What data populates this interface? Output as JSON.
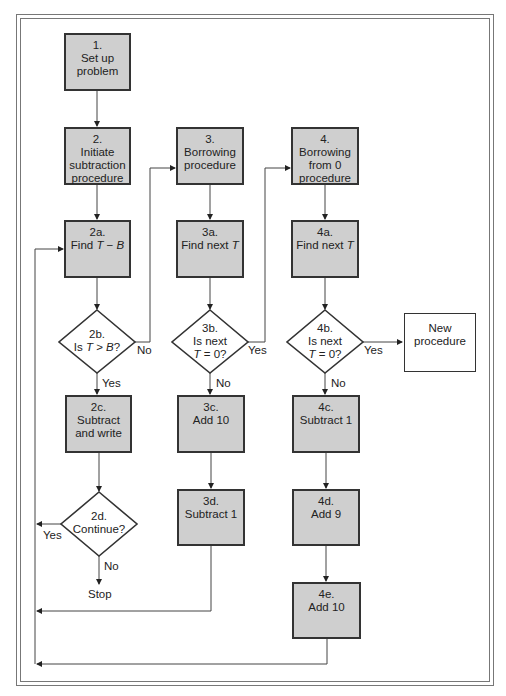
{
  "diagram": {
    "type": "flowchart",
    "nodes": [
      {
        "id": "1",
        "shape": "box",
        "num": "1.",
        "text": "Set up problem"
      },
      {
        "id": "2",
        "shape": "box",
        "num": "2.",
        "text": "Initiate subtraction procedure"
      },
      {
        "id": "2a",
        "shape": "box",
        "num": "2a.",
        "text": "Find T − B"
      },
      {
        "id": "2b",
        "shape": "diamond",
        "num": "2b.",
        "text": "Is T > B?"
      },
      {
        "id": "2c",
        "shape": "box",
        "num": "2c.",
        "text": "Subtract and write"
      },
      {
        "id": "2d",
        "shape": "diamond",
        "num": "2d.",
        "text": "Continue?"
      },
      {
        "id": "stop",
        "shape": "terminal-text",
        "text": "Stop"
      },
      {
        "id": "3",
        "shape": "box",
        "num": "3.",
        "text": "Borrowing procedure"
      },
      {
        "id": "3a",
        "shape": "box",
        "num": "3a.",
        "text": "Find next T"
      },
      {
        "id": "3b",
        "shape": "diamond",
        "num": "3b.",
        "text": "Is next T = 0?"
      },
      {
        "id": "3c",
        "shape": "box",
        "num": "3c.",
        "text": "Add 10"
      },
      {
        "id": "3d",
        "shape": "box",
        "num": "3d.",
        "text": "Subtract 1"
      },
      {
        "id": "4",
        "shape": "box",
        "num": "4.",
        "text": "Borrowing from 0 procedure"
      },
      {
        "id": "4a",
        "shape": "box",
        "num": "4a.",
        "text": "Find next T"
      },
      {
        "id": "4b",
        "shape": "diamond",
        "num": "4b.",
        "text": "Is next T = 0?"
      },
      {
        "id": "4c",
        "shape": "box",
        "num": "4c.",
        "text": "Subtract 1"
      },
      {
        "id": "4d",
        "shape": "box",
        "num": "4d.",
        "text": "Add 9"
      },
      {
        "id": "4e",
        "shape": "box",
        "num": "4e.",
        "text": "Add 10"
      },
      {
        "id": "new",
        "shape": "box-white",
        "text": "New procedure"
      }
    ],
    "edges": [
      {
        "from": "1",
        "to": "2"
      },
      {
        "from": "2",
        "to": "2a"
      },
      {
        "from": "2a",
        "to": "2b"
      },
      {
        "from": "2b",
        "to": "2c",
        "label": "Yes"
      },
      {
        "from": "2b",
        "to": "3",
        "label": "No"
      },
      {
        "from": "2c",
        "to": "2d"
      },
      {
        "from": "2d",
        "to": "2a",
        "label": "Yes"
      },
      {
        "from": "2d",
        "to": "stop",
        "label": "No"
      },
      {
        "from": "3",
        "to": "3a"
      },
      {
        "from": "3a",
        "to": "3b"
      },
      {
        "from": "3b",
        "to": "3c",
        "label": "No"
      },
      {
        "from": "3b",
        "to": "4",
        "label": "Yes"
      },
      {
        "from": "3c",
        "to": "3d"
      },
      {
        "from": "3d",
        "to": "2a"
      },
      {
        "from": "4",
        "to": "4a"
      },
      {
        "from": "4a",
        "to": "4b"
      },
      {
        "from": "4b",
        "to": "4c",
        "label": "No"
      },
      {
        "from": "4b",
        "to": "new",
        "label": "Yes"
      },
      {
        "from": "4c",
        "to": "4d"
      },
      {
        "from": "4d",
        "to": "4e"
      },
      {
        "from": "4e",
        "to": "2a"
      }
    ]
  },
  "labels": {
    "n1_num": "1.",
    "n1_a": "Set up",
    "n1_b": "problem",
    "n2_num": "2.",
    "n2_a": "Initiate",
    "n2_b": "subtraction",
    "n2_c": "procedure",
    "n2a_num": "2a.",
    "n2a_pre": "Find ",
    "n2a_T": "T",
    "n2a_op": " − ",
    "n2a_B": "B",
    "n2b_num": "2b.",
    "n2b_pre": "Is ",
    "n2b_T": "T",
    "n2b_op": " > ",
    "n2b_B": "B",
    "n2b_q": "?",
    "n2c_num": "2c.",
    "n2c_a": "Subtract",
    "n2c_b": "and write",
    "n2d_num": "2d.",
    "n2d_a": "Continue?",
    "stop": "Stop",
    "n3_num": "3.",
    "n3_a": "Borrowing",
    "n3_b": "procedure",
    "n3a_num": "3a.",
    "n3a_pre": "Find next ",
    "n3a_T": "T",
    "n3b_num": "3b.",
    "n3b_a": "Is next",
    "n3b_T": "T",
    "n3b_rest": " = 0?",
    "n3c_num": "3c.",
    "n3c_a": "Add 10",
    "n3d_num": "3d.",
    "n3d_a": "Subtract 1",
    "n4_num": "4.",
    "n4_a": "Borrowing",
    "n4_b": "from 0",
    "n4_c": "procedure",
    "n4a_num": "4a.",
    "n4a_pre": "Find next ",
    "n4a_T": "T",
    "n4b_num": "4b.",
    "n4b_a": "Is next",
    "n4b_T": "T",
    "n4b_rest": " = 0?",
    "n4c_num": "4c.",
    "n4c_a": "Subtract 1",
    "n4d_num": "4d.",
    "n4d_a": "Add 9",
    "n4e_num": "4e.",
    "n4e_a": "Add 10",
    "new_a": "New",
    "new_b": "procedure",
    "yes": "Yes",
    "no": "No"
  },
  "colors": {
    "box_fill": "#cfcfcf",
    "line": "#333333",
    "frame": "#777777"
  }
}
